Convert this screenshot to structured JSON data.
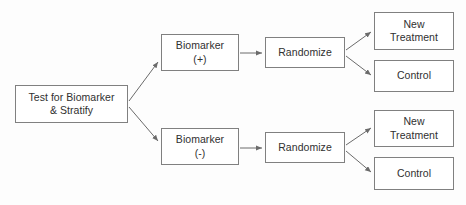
{
  "diagram": {
    "type": "flowchart",
    "canvas": {
      "width": 466,
      "height": 205,
      "background": "#fdfdfd"
    },
    "style": {
      "box_border_color": "#808080",
      "box_fill_color": "#ffffff",
      "text_color": "#303030",
      "edge_color": "#6b6b6b"
    },
    "nodes": [
      {
        "id": "test_stratify",
        "label": "Test for  Biomarker\n& Stratify"
      },
      {
        "id": "biomarker_pos",
        "label": "Biomarker\n(+)"
      },
      {
        "id": "randomize_pos",
        "label": "Randomize"
      },
      {
        "id": "new_treatment_pos",
        "label": "New\nTreatment"
      },
      {
        "id": "control_pos",
        "label": "Control"
      },
      {
        "id": "biomarker_neg",
        "label": "Biomarker\n(-)"
      },
      {
        "id": "randomize_neg",
        "label": "Randomize"
      },
      {
        "id": "new_treatment_neg",
        "label": "New\nTreatment"
      },
      {
        "id": "control_neg",
        "label": "Control"
      }
    ],
    "edges": [
      {
        "from": "test_stratify",
        "to": "biomarker_pos",
        "label": ""
      },
      {
        "from": "test_stratify",
        "to": "biomarker_neg",
        "label": ""
      },
      {
        "from": "biomarker_pos",
        "to": "randomize_pos",
        "label": ""
      },
      {
        "from": "biomarker_neg",
        "to": "randomize_neg",
        "label": ""
      },
      {
        "from": "randomize_pos",
        "to": "new_treatment_pos",
        "label": ""
      },
      {
        "from": "randomize_pos",
        "to": "control_pos",
        "label": ""
      },
      {
        "from": "randomize_neg",
        "to": "new_treatment_neg",
        "label": ""
      },
      {
        "from": "randomize_neg",
        "to": "control_neg",
        "label": ""
      }
    ]
  }
}
